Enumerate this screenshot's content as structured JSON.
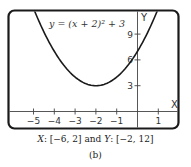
{
  "chart_data": {
    "type": "line",
    "equation": "y = (x + 2)² + 3",
    "xlabel": "X",
    "ylabel": "Y",
    "xlim": [
      -6,
      2
    ],
    "ylim": [
      -2,
      12
    ],
    "x_ticks": [
      -5,
      -4,
      -3,
      -2,
      -1,
      1
    ],
    "x_tick_labels": [
      "−5",
      "−4",
      "−3",
      "−2",
      "−1",
      "1"
    ],
    "y_ticks": [
      3,
      6,
      9
    ],
    "y_tick_labels": [
      "3",
      "6",
      "9"
    ],
    "grid": false,
    "series": [
      {
        "name": "y = (x + 2)^2 + 3",
        "x": [
          -5.1,
          -5,
          -4.5,
          -4,
          -3.5,
          -3,
          -2.5,
          -2,
          -1.5,
          -1,
          -0.5,
          0,
          0.5,
          1,
          1.1
        ],
        "y": [
          12.61,
          12,
          9.25,
          7,
          5.25,
          4,
          3.25,
          3,
          3.25,
          4,
          5.25,
          7,
          9.25,
          12,
          12.61
        ]
      }
    ],
    "vertex": [
      -2,
      3
    ],
    "y_intercept": 7,
    "color": "#1a1a1a"
  },
  "caption": {
    "range_x_label": "X",
    "range_x_value": ": [−6, 2] and ",
    "range_y_label": "Y",
    "range_y_value": ": [−2, 12]",
    "part_label": "(b)"
  }
}
